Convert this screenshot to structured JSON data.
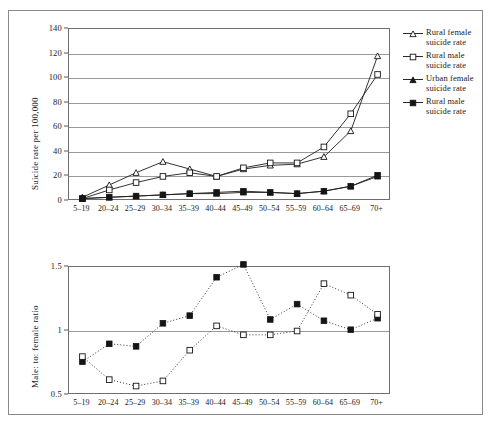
{
  "figure": {
    "background": "#ffffff",
    "frame_color": "#8a8a8a"
  },
  "chart_data": [
    {
      "type": "line",
      "panel": "top",
      "title": "",
      "xlabel": "",
      "ylabel": "Suicide rate per 100,000",
      "ylim": [
        0,
        140
      ],
      "yticks": [
        0,
        20,
        40,
        60,
        80,
        100,
        120,
        140
      ],
      "grid": true,
      "legend_position": "right",
      "categories": [
        "5–19",
        "20–24",
        "25–29",
        "30–34",
        "35–39",
        "40–44",
        "45–49",
        "50–54",
        "55–59",
        "60–64",
        "65–69",
        "70+"
      ],
      "series": [
        {
          "name": "Rural female suicide rate",
          "marker": "open-triangle",
          "values": [
            3,
            13,
            23,
            32,
            26,
            20,
            26,
            29,
            30,
            36,
            57,
            118
          ]
        },
        {
          "name": "Rural male suicide rate",
          "marker": "open-square",
          "values": [
            2,
            9,
            15,
            20,
            23,
            20,
            27,
            31,
            31,
            44,
            71,
            103
          ]
        },
        {
          "name": "Urban female suicide rate",
          "marker": "filled-triangle",
          "values": [
            2,
            3,
            4,
            5,
            6,
            6,
            7,
            7,
            6,
            8,
            12,
            20
          ]
        },
        {
          "name": "Rural male suicide rate",
          "marker": "filled-square",
          "values": [
            2,
            3,
            4,
            5,
            6,
            7,
            8,
            7,
            6,
            8,
            12,
            21
          ]
        }
      ]
    },
    {
      "type": "scatter",
      "panel": "bottom",
      "title": "",
      "xlabel": "",
      "ylabel": "Male: to: female ratio",
      "ylim": [
        0.5,
        1.5
      ],
      "yticks": [
        0.5,
        1,
        1.5
      ],
      "ytick_labels": [
        "0.5",
        "1",
        "1.5"
      ],
      "grid": true,
      "legend_position": "none",
      "categories": [
        "5–19",
        "20–24",
        "25–29",
        "30–34",
        "35–39",
        "40–44",
        "45–49",
        "50–54",
        "55–59",
        "60–64",
        "65–69",
        "70+"
      ],
      "series": [
        {
          "name": "urban-ratio",
          "marker": "filled-square",
          "linestyle": "dotted",
          "values": [
            0.76,
            0.9,
            0.88,
            1.06,
            1.12,
            1.42,
            1.52,
            1.09,
            1.21,
            1.08,
            1.01,
            1.1
          ]
        },
        {
          "name": "rural-ratio",
          "marker": "open-square",
          "linestyle": "dotted",
          "values": [
            0.8,
            0.62,
            0.57,
            0.61,
            0.85,
            1.04,
            0.97,
            0.97,
            1.0,
            1.37,
            1.28,
            1.13
          ]
        }
      ]
    }
  ],
  "legend": {
    "items": [
      {
        "label": "Rural female\nsuicide rate",
        "marker": "open-triangle"
      },
      {
        "label": "Rural male\nsuicide rate",
        "marker": "open-square"
      },
      {
        "label": "Urban female\nsuicide rate",
        "marker": "filled-triangle"
      },
      {
        "label": "Rural male\nsuicide rate",
        "marker": "filled-square"
      }
    ]
  }
}
